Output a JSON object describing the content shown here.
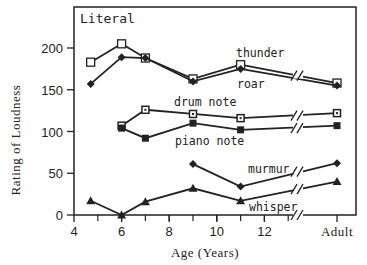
{
  "chart_data": {
    "type": "line",
    "title": "Literal",
    "xlabel": "Age (Years)",
    "ylabel": "Rating of Loudness",
    "ylim": [
      0,
      230
    ],
    "yticks": [
      0,
      50,
      100,
      150,
      200
    ],
    "xticks": [
      "4",
      "6",
      "8",
      "10",
      "12",
      "Adult"
    ],
    "x": [
      4.7,
      6,
      7,
      9,
      11,
      "Adult"
    ],
    "grid": false,
    "legend": "inline labels",
    "series": [
      {
        "name": "thunder",
        "marker": "open-square",
        "values": [
          183,
          205,
          188,
          163,
          180,
          158
        ]
      },
      {
        "name": "roar",
        "marker": "diamond",
        "values": [
          157,
          189,
          188,
          160,
          175,
          155
        ]
      },
      {
        "name": "drum note",
        "marker": "dotted-square",
        "values": [
          null,
          107,
          126,
          121,
          116,
          122
        ]
      },
      {
        "name": "piano note",
        "marker": "filled-square",
        "values": [
          null,
          104,
          92,
          110,
          102,
          107
        ]
      },
      {
        "name": "murmur",
        "marker": "filled-diamond",
        "values": [
          null,
          null,
          null,
          61,
          34,
          62
        ]
      },
      {
        "name": "whisper",
        "marker": "filled-triangle",
        "values": [
          17,
          0,
          16,
          32,
          17,
          40
        ]
      }
    ]
  }
}
